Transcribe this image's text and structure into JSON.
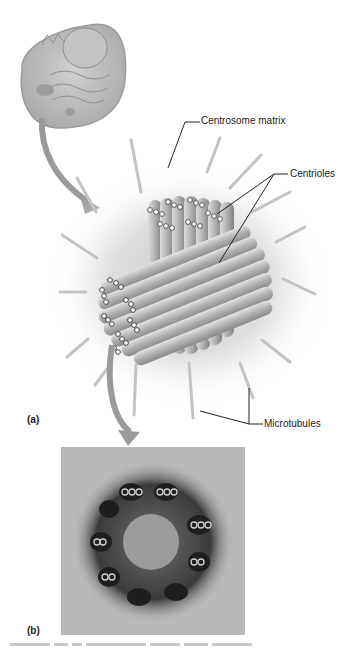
{
  "figure": {
    "panel_a": {
      "label": "(a)",
      "callouts": {
        "centrosome_matrix": "Centrosome matrix",
        "centrioles": "Centrioles",
        "microtubules": "Microtubules"
      }
    },
    "panel_b": {
      "label": "(b)"
    },
    "colors": {
      "arrow": "#9a9a9a",
      "tubule": "#b5b5b5",
      "matrix_halo": "#d8d8d8",
      "leader_line": "#222222"
    }
  }
}
